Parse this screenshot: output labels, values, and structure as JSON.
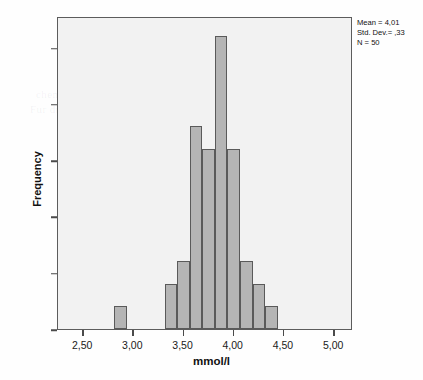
{
  "chart_data": {
    "type": "bar",
    "title": "",
    "xlabel": "mmol/l",
    "ylabel": "Frequency",
    "xlim": [
      2.25,
      5.1875
    ],
    "ylim": [
      0,
      13.9
    ],
    "grid": false,
    "bin_width": 0.125,
    "x": [
      2.875,
      3.375,
      3.5,
      3.625,
      3.75,
      3.875,
      4.0,
      4.125,
      4.25,
      4.375,
      4.5
    ],
    "bin_left_edges": [
      2.8125,
      3.3125,
      3.4375,
      3.5625,
      3.6875,
      3.8125,
      3.9375,
      4.0625,
      4.1875,
      4.3125,
      4.4375
    ],
    "values": [
      1,
      2,
      3,
      9,
      8,
      13,
      8,
      3,
      2,
      1,
      0
    ],
    "categories": [
      "2,875",
      "3,375",
      "3,500",
      "3,625",
      "3,750",
      "3,875",
      "4,000",
      "4,125",
      "4,250",
      "4,375",
      "4,500"
    ],
    "xticks": [
      2.5,
      3.0,
      3.5,
      4.0,
      4.5,
      5.0
    ],
    "xtick_labels": [
      "2,50",
      "3,00",
      "3,50",
      "4,00",
      "4,50",
      "5,00"
    ],
    "yticks": [
      0.0,
      2.5,
      5.0,
      7.5,
      10.0,
      12.5
    ],
    "ytick_labels": [
      "0,0",
      "2,5",
      "5,0",
      "7,5",
      "10,0",
      "12,5"
    ],
    "bar_fill": "#b5b5b5",
    "bar_edge": "#5a5a5a",
    "plot_background": "#f2f2f2",
    "annotations": [
      "Mean = 4,01",
      "Std. Dev.= ,33",
      "N = 50"
    ]
  },
  "stats": {
    "mean_line": "Mean = 4,01",
    "stddev_line": "Std. Dev.= ,33",
    "n_line": "N = 50"
  },
  "axes": {
    "x_title": "mmol/l",
    "y_title": "Frequency"
  },
  "bleed_text": {
    "line1": "a Question",
    "line2": "chemical typischen Blutzucker and ano to th",
    "line3": "Fur die sampler and  probleme   lut  hetzelgruen  wurde",
    "line4": "Messung Protein des Standards",
    "line5": "Beispiel fur die Funktion",
    "line6": "anza"
  }
}
